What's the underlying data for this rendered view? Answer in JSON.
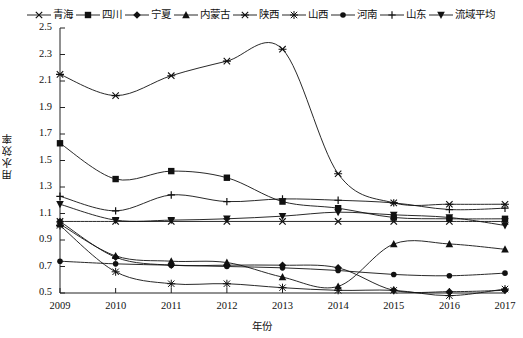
{
  "chart_data": {
    "type": "line",
    "title": "",
    "xlabel": "年份",
    "ylabel": "用水效率",
    "x": [
      2009,
      2010,
      2011,
      2012,
      2013,
      2014,
      2015,
      2016,
      2017
    ],
    "categories": [
      "2009",
      "2010",
      "2011",
      "2012",
      "2013",
      "2014",
      "2015",
      "2016",
      "2017"
    ],
    "xlim": [
      2009,
      2017
    ],
    "ylim": [
      0.5,
      2.5
    ],
    "yticks": [
      "0.5",
      "0.7",
      "0.9",
      "1.1",
      "1.3",
      "1.5",
      "1.7",
      "1.9",
      "2.1",
      "2.3",
      "2.5"
    ],
    "ytick_step": 0.2,
    "grid": false,
    "legend_position": "top-center",
    "series": [
      {
        "name": "青海",
        "marker": "x",
        "values": [
          1.04,
          1.04,
          1.04,
          1.04,
          1.04,
          1.04,
          1.04,
          1.04,
          1.04
        ]
      },
      {
        "name": "四川",
        "marker": "square",
        "values": [
          1.63,
          1.36,
          1.42,
          1.37,
          1.19,
          1.14,
          1.07,
          1.06,
          1.06
        ]
      },
      {
        "name": "宁夏",
        "marker": "diamond",
        "values": [
          1.04,
          0.77,
          0.71,
          0.71,
          0.71,
          0.69,
          0.52,
          0.51,
          0.52
        ]
      },
      {
        "name": "内蒙古",
        "marker": "triangle",
        "values": [
          1.02,
          0.78,
          0.74,
          0.73,
          0.62,
          0.55,
          0.87,
          0.87,
          0.83
        ]
      },
      {
        "name": "陕西",
        "marker": "star",
        "values": [
          2.15,
          1.99,
          2.14,
          2.25,
          2.34,
          1.4,
          1.18,
          1.17,
          1.17
        ]
      },
      {
        "name": "山西",
        "marker": "asterisk",
        "values": [
          1.01,
          0.66,
          0.57,
          0.57,
          0.54,
          0.52,
          0.52,
          0.48,
          0.53
        ]
      },
      {
        "name": "河南",
        "marker": "dot",
        "values": [
          0.74,
          0.72,
          0.71,
          0.7,
          0.69,
          0.67,
          0.64,
          0.63,
          0.65
        ]
      },
      {
        "name": "山东",
        "marker": "plus",
        "values": [
          1.23,
          1.12,
          1.24,
          1.19,
          1.21,
          1.2,
          1.18,
          1.13,
          1.14
        ]
      },
      {
        "name": "流域平均",
        "marker": "tri-down",
        "values": [
          1.17,
          1.05,
          1.05,
          1.06,
          1.08,
          1.11,
          1.09,
          1.07,
          1.01
        ]
      }
    ]
  }
}
